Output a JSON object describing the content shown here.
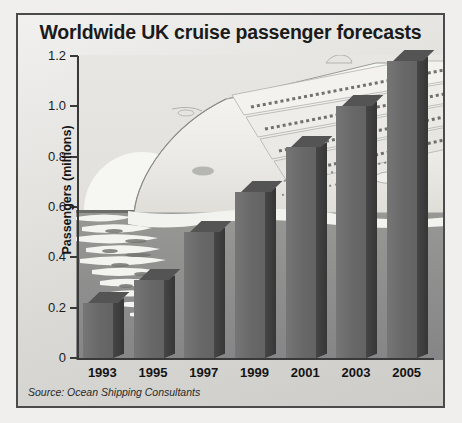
{
  "figure": {
    "title": "Worldwide UK cruise passenger forecasts",
    "source": "Source: Ocean Shipping Consultants",
    "frame_color": "#4c4c4c",
    "paper_color": "#e9e8e4",
    "bar_face_color": "#6e6e6e",
    "bar_side_color": "#3e3e3e",
    "bar_top_color": "#565656",
    "background_art": "cruise-ship-illustration"
  },
  "chart_data": {
    "type": "bar",
    "title": "Worldwide UK cruise passenger forecasts",
    "xlabel": "",
    "ylabel": "Passengers (millions)",
    "categories": [
      "1993",
      "1995",
      "1997",
      "1999",
      "2001",
      "2003",
      "2005"
    ],
    "values": [
      0.22,
      0.31,
      0.5,
      0.66,
      0.84,
      1.0,
      1.18
    ],
    "ylim": [
      0,
      1.2
    ],
    "ytick_labels": [
      "0",
      "0.2",
      "0.4",
      "0.6",
      "0.8",
      "1.0",
      "1.2"
    ],
    "ytick_values": [
      0,
      0.2,
      0.4,
      0.6,
      0.8,
      1.0,
      1.2
    ],
    "grid": false,
    "legend": "none",
    "style": "3d-bars-grayscale",
    "source": "Source: Ocean Shipping Consultants"
  }
}
